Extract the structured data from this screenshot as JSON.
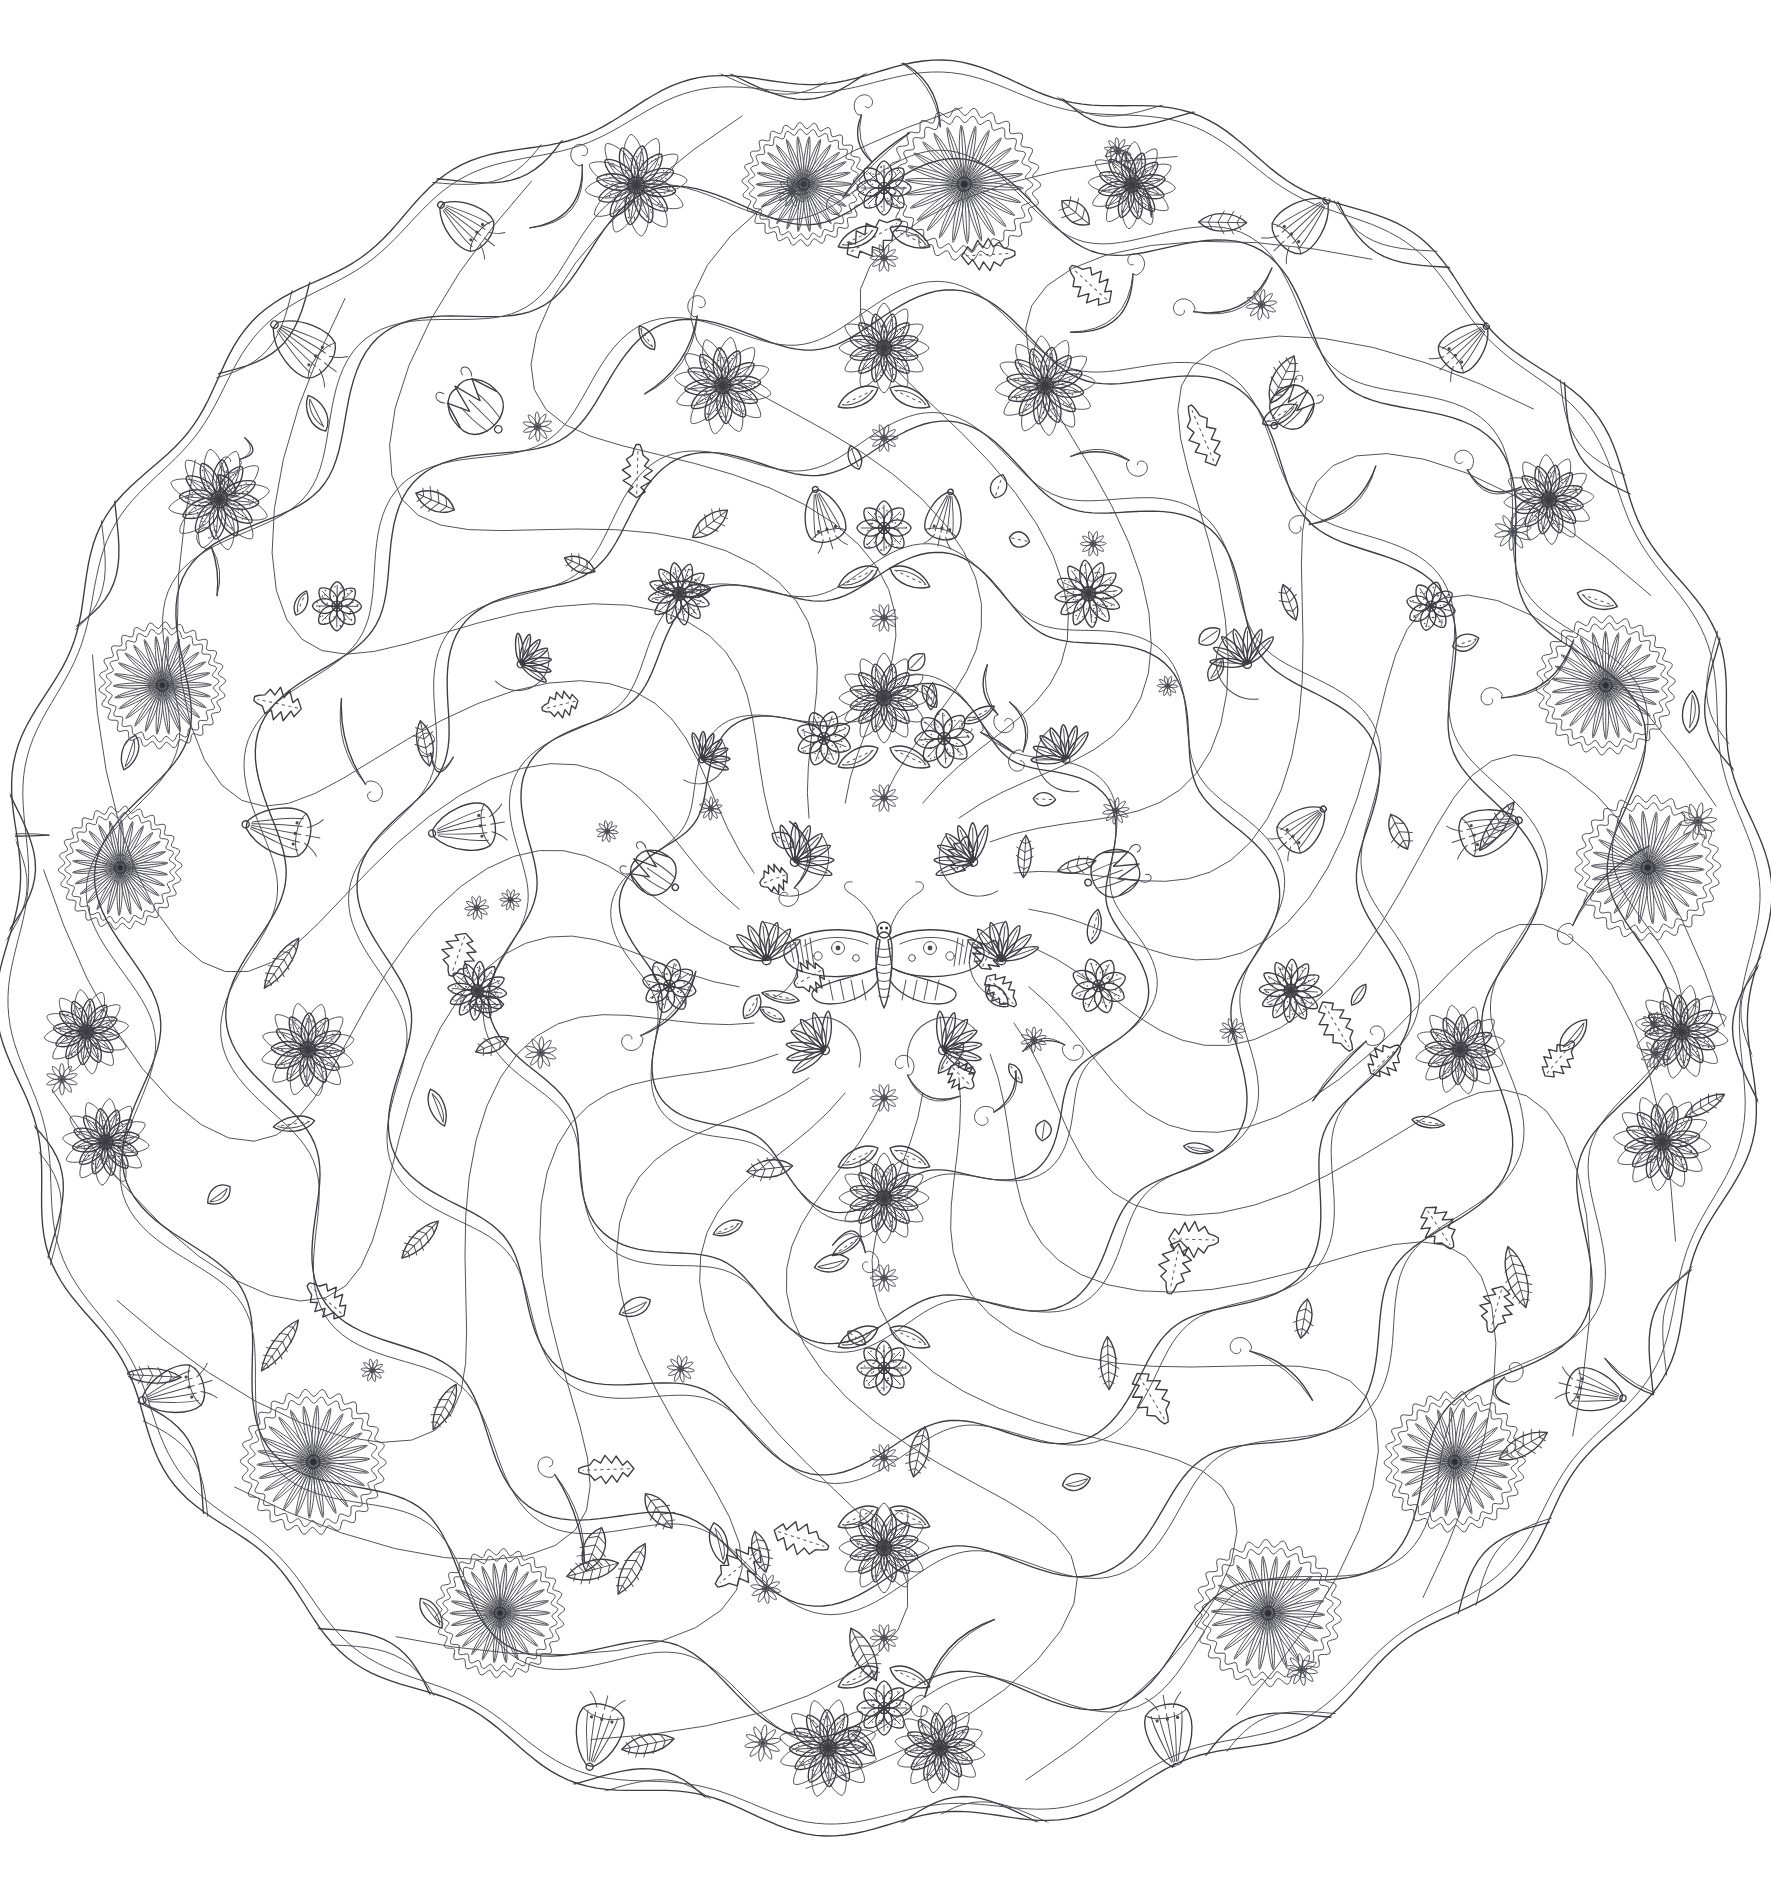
{
  "artwork": {
    "title": "Secret Garden Floral Mandala",
    "type": "line-art colouring page",
    "medium": "pen and ink line drawing",
    "background_color": "#ffffff",
    "ink_color": "#2f2f33",
    "secondary_ink_color": "#4a4a52",
    "canvas": {
      "width": 1771,
      "height": 1893
    },
    "composition": {
      "shape": "circular mandala / rondel",
      "center_x": 884,
      "center_y": 948,
      "outer_radius": 884,
      "symmetry": "bilateral mirror about the vertical axis, with radial rings",
      "corner_treatment": "blank white corners outside the circle",
      "edge_style": "scalloped / lobed petal outline"
    },
    "rings": [
      {
        "name": "center-medallion",
        "inner_radius": 0,
        "outer_radius": 150,
        "motif": "moth with large open daisies"
      },
      {
        "name": "inner-ring",
        "inner_radius": 150,
        "outer_radius": 330,
        "motif": "tulips, fan-flowers, scrolling vines"
      },
      {
        "name": "middle-ring",
        "inner_radius": 330,
        "outer_radius": 540,
        "motif": "12-petal daisies, serrated leaves, bellflowers"
      },
      {
        "name": "outer-ring",
        "inner_radius": 540,
        "outer_radius": 720,
        "motif": "large daisies, bellflowers, striped leaves"
      },
      {
        "name": "border-ring",
        "inner_radius": 720,
        "outer_radius": 884,
        "motif": "chrysanthemums, small pinwheel daisies, scalloped lobes"
      }
    ],
    "motifs": [
      {
        "id": "chrysanthemum",
        "label": "Chrysanthemum",
        "petal_count": 26,
        "description": "dense radial many-petalled bloom with scalloped outer collar and small ringed center"
      },
      {
        "id": "daisy-large",
        "label": "Large daisy",
        "petal_count": 12,
        "description": "two rings of rounded petals with stippled shading and ringed center"
      },
      {
        "id": "daisy-medium",
        "label": "Medium daisy",
        "petal_count": 8,
        "description": "eight rounded petals, dotted center, fine radial hatching"
      },
      {
        "id": "daisy-small",
        "label": "Small pinwheel daisy",
        "petal_count": 10,
        "description": "tiny slender-petalled flower on a curling stem"
      },
      {
        "id": "bellflower",
        "label": "Bellflower",
        "petal_count": 5,
        "description": "nodding bell-shaped blossom with ribbed skirt and curling stamens"
      },
      {
        "id": "tulip",
        "label": "Tulip",
        "petal_count": 6,
        "description": "upright cup with pointed lobes and tendrils"
      },
      {
        "id": "fan-flower",
        "label": "Fan flower",
        "petal_count": 7,
        "description": "half-round fan of lobed petals radiating from a bead"
      },
      {
        "id": "leaf-striped",
        "label": "Striped leaf",
        "description": "lanceolate leaf filled with parallel diagonal hatching"
      },
      {
        "id": "leaf-serrated",
        "label": "Serrated leaf",
        "description": "jagged-edged leaf with a dashed midrib"
      },
      {
        "id": "leaf-teardrop",
        "label": "Teardrop leaf",
        "description": "small pointed leaf with a dotted spine"
      },
      {
        "id": "vine-scroll",
        "label": "Scrolling vine",
        "description": "sweeping double-line stem ending in a tight spiral curl"
      },
      {
        "id": "moth",
        "label": "Moth",
        "description": "central moth with eye-spotted, banded wings and long antennae"
      }
    ],
    "palette": {
      "paper": "#ffffff",
      "ink": "#2f2f33",
      "ink_light": "#4a4a52",
      "ink_dash": "#55555d"
    }
  }
}
